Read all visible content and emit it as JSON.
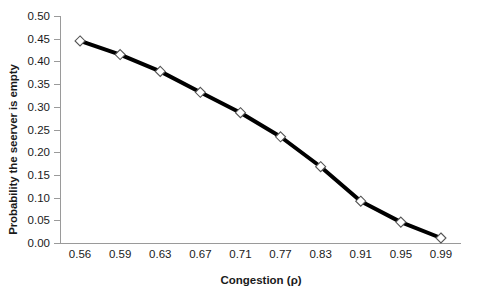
{
  "chart_data": {
    "type": "line",
    "title": "",
    "subtitle": "",
    "xlabel": "Congestion (ρ)",
    "ylabel": "Probability the seerver is empty",
    "categories": [
      "0.56",
      "0.59",
      "0.63",
      "0.67",
      "0.71",
      "0.77",
      "0.83",
      "0.91",
      "0.95",
      "0.99"
    ],
    "x": [
      0.56,
      0.59,
      0.63,
      0.67,
      0.71,
      0.77,
      0.83,
      0.91,
      0.95,
      0.99
    ],
    "values": [
      0.445,
      0.415,
      0.378,
      0.332,
      0.287,
      0.234,
      0.168,
      0.092,
      0.046,
      0.011
    ],
    "series": [
      {
        "name": "Probability the seerver is empty",
        "values": [
          0.445,
          0.415,
          0.378,
          0.332,
          0.287,
          0.234,
          0.168,
          0.092,
          0.046,
          0.011
        ],
        "color": "#000000",
        "marker": "diamond",
        "line_width": 4
      }
    ],
    "ylim": [
      0.0,
      0.5
    ],
    "y_ticks": [
      "0.00",
      "0.05",
      "0.10",
      "0.15",
      "0.20",
      "0.25",
      "0.30",
      "0.35",
      "0.40",
      "0.45",
      "0.50"
    ],
    "y_tick_values": [
      0.0,
      0.05,
      0.1,
      0.15,
      0.2,
      0.25,
      0.3,
      0.35,
      0.4,
      0.45,
      0.5
    ],
    "grid": false,
    "legend": false,
    "legend_position": "none",
    "axis_color": "#9a9a9a",
    "text_color": "#1a1a1a",
    "background": "#ffffff"
  }
}
